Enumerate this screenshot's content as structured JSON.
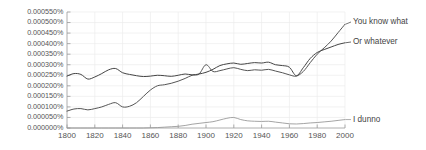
{
  "chart_data": {
    "type": "line",
    "title": "",
    "xlabel": "",
    "ylabel": "",
    "xlim": [
      1800,
      2000
    ],
    "ylim": [
      0.0,
      0.00055
    ],
    "grid": true,
    "legend_position": "right-inline",
    "yticks": [
      0.0,
      5e-05,
      0.0001,
      0.00015,
      0.0002,
      0.00025,
      0.0003,
      0.00035,
      0.0004,
      0.00045,
      0.0005,
      0.00055
    ],
    "ytick_labels": [
      "0.000000%",
      "0.000050%",
      "0.000100%",
      "0.000150%",
      "0.000200%",
      "0.000250%",
      "0.000300%",
      "0.000350%",
      "0.000400%",
      "0.000450%",
      "0.000500%",
      "0.000550%"
    ],
    "xticks": [
      1800,
      1820,
      1840,
      1860,
      1880,
      1900,
      1920,
      1940,
      1960,
      1980,
      2000
    ],
    "xtick_labels": [
      "1800",
      "1820",
      "1840",
      "1860",
      "1880",
      "1900",
      "1920",
      "1940",
      "1960",
      "1980",
      "2000"
    ],
    "x": [
      1800,
      1805,
      1810,
      1815,
      1820,
      1825,
      1830,
      1835,
      1840,
      1845,
      1850,
      1855,
      1860,
      1865,
      1870,
      1875,
      1880,
      1885,
      1890,
      1895,
      1900,
      1905,
      1910,
      1915,
      1920,
      1925,
      1930,
      1935,
      1940,
      1945,
      1950,
      1955,
      1960,
      1965,
      1970,
      1975,
      1980,
      1985,
      1990,
      1995,
      2000
    ],
    "series": [
      {
        "name": "You know what",
        "color": "#555555",
        "values": [
          8e-05,
          9e-05,
          9.2e-05,
          8.6e-05,
          9.2e-05,
          0.0001,
          0.000112,
          0.00012,
          0.0001,
          0.000103,
          0.00012,
          0.00015,
          0.00018,
          0.0002,
          0.000205,
          0.000212,
          0.000222,
          0.000235,
          0.00025,
          0.000256,
          0.0003,
          0.000268,
          0.000272,
          0.00028,
          0.000286,
          0.000278,
          0.000272,
          0.000276,
          0.000274,
          0.000278,
          0.00027,
          0.000262,
          0.000252,
          0.000246,
          0.000268,
          0.00031,
          0.00035,
          0.00038,
          0.000412,
          0.000452,
          0.000492
        ],
        "end_label": "You know what"
      },
      {
        "name": "Or whatever",
        "color": "#444444",
        "values": [
          0.000246,
          0.000258,
          0.000254,
          0.000232,
          0.000242,
          0.000258,
          0.000276,
          0.000282,
          0.000262,
          0.000254,
          0.000248,
          0.000244,
          0.000246,
          0.00025,
          0.000248,
          0.000245,
          0.00025,
          0.000256,
          0.000252,
          0.000256,
          0.000264,
          0.000278,
          0.000296,
          0.000304,
          0.000308,
          0.000302,
          0.000306,
          0.00031,
          0.000308,
          0.000312,
          0.0003,
          0.000296,
          0.000288,
          0.000248,
          0.000286,
          0.00033,
          0.000358,
          0.000372,
          0.000384,
          0.000396,
          0.000404
        ],
        "end_label": "Or whatever"
      },
      {
        "name": "I dunno",
        "color": "#9a9a9a",
        "values": [
          0.0,
          0.0,
          0.0,
          0.0,
          0.0,
          0.0,
          0.0,
          0.0,
          0.0,
          0.0,
          0.0,
          0.0,
          1e-06,
          2e-06,
          4e-06,
          6e-06,
          8e-06,
          1.2e-05,
          1.8e-05,
          2.2e-05,
          2.6e-05,
          3e-05,
          3.8e-05,
          4.6e-05,
          5e-05,
          4e-05,
          3.4e-05,
          3.2e-05,
          3.1e-05,
          3.2e-05,
          2.8e-05,
          2.4e-05,
          2e-05,
          1.9e-05,
          2.1e-05,
          2.4e-05,
          2.6e-05,
          2.9e-05,
          3.2e-05,
          3.6e-05,
          4e-05
        ],
        "end_label": "I dunno"
      }
    ]
  }
}
